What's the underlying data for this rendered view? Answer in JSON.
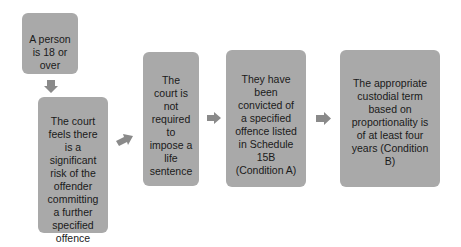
{
  "diagram": {
    "colors": {
      "box": "#a9a9a9",
      "arrow": "#8a8a8a",
      "text": "#1a1a1a",
      "background": "#ffffff"
    },
    "boxes": [
      {
        "id": "age",
        "text": "A person\nis 18 or\nover"
      },
      {
        "id": "risk",
        "text": "The court\nfeels there\nis a\nsignificant\nrisk of the\noffender\ncommitting\na further\nspecified\noffence"
      },
      {
        "id": "life",
        "text": "The\ncourt is\nnot\nrequired\nto\nimpose a\nlife\nsentence"
      },
      {
        "id": "condition-a",
        "text": "They have\nbeen\nconvicted of\na specified\noffence listed\nin Schedule\n15B\n(Condition A)"
      },
      {
        "id": "condition-b",
        "text": "The appropriate\ncustodial term\nbased on\nproportionality is\nof at least four\nyears (Condition\nB)"
      }
    ],
    "arrows": [
      {
        "from": "age",
        "to": "risk",
        "direction": "down"
      },
      {
        "from": "risk",
        "to": "life",
        "direction": "up-right"
      },
      {
        "from": "life",
        "to": "condition-a",
        "direction": "right"
      },
      {
        "from": "condition-a",
        "to": "condition-b",
        "direction": "right"
      }
    ]
  }
}
